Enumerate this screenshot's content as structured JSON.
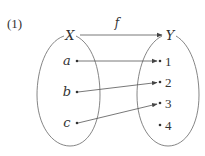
{
  "problem_label": "(1)",
  "function_label": "f",
  "domain_set": {
    "name": "X",
    "elements": [
      "a",
      "b",
      "c"
    ]
  },
  "codomain_set": {
    "name": "Y",
    "elements": [
      "1",
      "2",
      "3",
      "4"
    ]
  },
  "mapping": [
    {
      "from": "a",
      "to": "1"
    },
    {
      "from": "b",
      "to": "2"
    },
    {
      "from": "c",
      "to": "3"
    }
  ],
  "colors": {
    "stroke": "#555555",
    "text": "#333333"
  }
}
